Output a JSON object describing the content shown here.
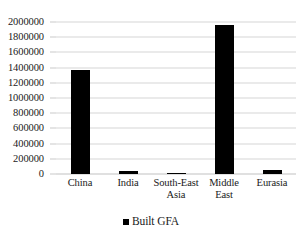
{
  "chart_data": {
    "type": "bar",
    "title": "",
    "subtitle": "",
    "xlabel": "",
    "ylabel": "",
    "categories": [
      "China",
      "India",
      "South-East Asia",
      "Middle East",
      "Eurasia"
    ],
    "series": [
      {
        "name": "Built GFA",
        "values": [
          1375000,
          40000,
          15000,
          1960000,
          55000
        ],
        "color": "#000000"
      }
    ],
    "ylim": [
      0,
      2000000
    ],
    "ytick_step": 200000,
    "ytick_labels": [
      "2000000",
      "1800000",
      "1600000",
      "1400000",
      "1200000",
      "1000000",
      "800000",
      "600000",
      "400000",
      "200000",
      "0"
    ],
    "ytick_values": [
      2000000,
      1800000,
      1600000,
      1400000,
      1200000,
      1000000,
      800000,
      600000,
      400000,
      200000,
      0
    ],
    "xtick_labels": [
      "China",
      "India",
      "South-East\nAsia",
      "Middle\nEast",
      "Eurasia"
    ],
    "grid": true,
    "grid_axis": "y",
    "legend": [
      "Built GFA"
    ],
    "legend_position": "bottom",
    "background_color": "#ffffff",
    "gridline_color": "#d6d6d6",
    "text_color": "#1a1a1a"
  },
  "legend": {
    "entry_label": "Built GFA"
  }
}
